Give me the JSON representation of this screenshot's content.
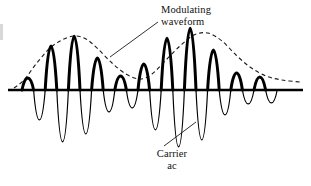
{
  "figure": {
    "background_color": "#ffffff",
    "ink_color": "#000000"
  },
  "labels": {
    "modulating": {
      "line1": "Modulating",
      "line2": "waveform"
    },
    "carrier": {
      "line1": "Carrier",
      "line2": "ac"
    }
  },
  "chart_data": {
    "type": "line",
    "xlabel": "",
    "ylabel": "",
    "grid": false,
    "legend": null,
    "axis": {
      "baseline_y": 90,
      "x_start": 8,
      "x_end": 303,
      "stroke_width": 2.6
    },
    "series": [
      {
        "name": "Carrier ac",
        "style": "solid",
        "description": "Carrier sine wave, positive half-cycles drawn bold, negative half-cycles drawn thin",
        "carrier_half_period_px": 11.6,
        "positive_stroke_width": 3.0,
        "negative_stroke_width": 1.2,
        "zero_crossings_x": [
          22,
          33.6,
          45.2,
          56.8,
          68.4,
          80,
          91.6,
          103.2,
          114.8,
          126.4,
          138,
          149.6,
          161.2,
          172.8,
          184.4,
          196,
          207.6,
          219.2,
          230.8,
          242.4,
          254,
          265.6,
          277.2,
          288.8
        ],
        "positive_peaks": [
          {
            "x": 27.8,
            "amplitude": 12
          },
          {
            "x": 51.0,
            "amplitude": 44
          },
          {
            "x": 74.2,
            "amplitude": 54
          },
          {
            "x": 97.4,
            "amplitude": 32
          },
          {
            "x": 120.6,
            "amplitude": 14
          },
          {
            "x": 143.8,
            "amplitude": 26
          },
          {
            "x": 167.0,
            "amplitude": 52
          },
          {
            "x": 190.2,
            "amplitude": 62
          },
          {
            "x": 213.4,
            "amplitude": 40
          },
          {
            "x": 236.6,
            "amplitude": 17
          },
          {
            "x": 259.8,
            "amplitude": 13
          }
        ],
        "negative_peaks": [
          {
            "x": 39.4,
            "amplitude": 30
          },
          {
            "x": 62.6,
            "amplitude": 52
          },
          {
            "x": 85.8,
            "amplitude": 44
          },
          {
            "x": 109.0,
            "amplitude": 22
          },
          {
            "x": 132.2,
            "amplitude": 18
          },
          {
            "x": 155.4,
            "amplitude": 40
          },
          {
            "x": 178.6,
            "amplitude": 57
          },
          {
            "x": 201.8,
            "amplitude": 50
          },
          {
            "x": 225.0,
            "amplitude": 25
          },
          {
            "x": 248.2,
            "amplitude": 14
          },
          {
            "x": 271.4,
            "amplitude": 13
          }
        ]
      },
      {
        "name": "Modulating waveform",
        "style": "dashed",
        "description": "Dashed envelope tracing the peaks of the positive carrier half-cycles",
        "stroke_width": 1.1,
        "dash_pattern": "4 3",
        "envelope_points": [
          {
            "x": 14,
            "y": 88
          },
          {
            "x": 24,
            "y": 80
          },
          {
            "x": 36,
            "y": 64
          },
          {
            "x": 50,
            "y": 48
          },
          {
            "x": 62,
            "y": 40
          },
          {
            "x": 74,
            "y": 36
          },
          {
            "x": 86,
            "y": 39
          },
          {
            "x": 98,
            "y": 49
          },
          {
            "x": 112,
            "y": 63
          },
          {
            "x": 126,
            "y": 74
          },
          {
            "x": 140,
            "y": 79
          },
          {
            "x": 152,
            "y": 74
          },
          {
            "x": 166,
            "y": 60
          },
          {
            "x": 180,
            "y": 46
          },
          {
            "x": 194,
            "y": 35
          },
          {
            "x": 208,
            "y": 33
          },
          {
            "x": 222,
            "y": 41
          },
          {
            "x": 236,
            "y": 55
          },
          {
            "x": 250,
            "y": 67
          },
          {
            "x": 266,
            "y": 76
          },
          {
            "x": 282,
            "y": 80
          },
          {
            "x": 300,
            "y": 82
          }
        ]
      }
    ],
    "annotations": [
      {
        "name": "modulating-waveform-label",
        "text": "Modulating waveform",
        "text_x": 161,
        "text_y": 10,
        "leader_from": [
          158,
          22
        ],
        "leader_to": [
          110,
          57
        ]
      },
      {
        "name": "carrier-ac-label",
        "text": "Carrier ac",
        "text_x": 172,
        "text_y": 154,
        "leader_from": [
          164,
          146
        ],
        "leader_to": [
          196,
          122
        ]
      }
    ]
  }
}
